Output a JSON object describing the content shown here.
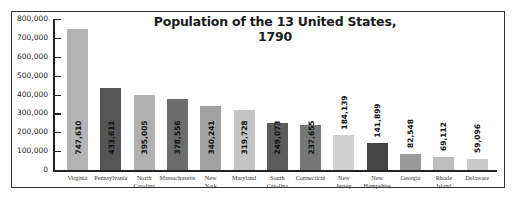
{
  "chart_data": {
    "type": "bar",
    "title": "Population of the 13 United States, 1790",
    "xlabel": "",
    "ylabel": "",
    "ylim": [
      0,
      800000
    ],
    "yticks": [
      "0",
      "100,000",
      "200,000",
      "300,000",
      "400,000",
      "500,000",
      "600,000",
      "700,000",
      "800,000"
    ],
    "grid": false,
    "legend": null,
    "categories": [
      "Virginia",
      "Pennsylvania",
      "North Carolina",
      "Massachusetts",
      "New York",
      "Maryland",
      "South Carolina",
      "Connecticut",
      "New Jersey",
      "New Hampshire",
      "Georgia",
      "Rhode Island",
      "Delaware"
    ],
    "category_lines": [
      [
        "Virginia"
      ],
      [
        "Pennsylvania"
      ],
      [
        "North",
        "Carolina"
      ],
      [
        "Massachusetts"
      ],
      [
        "New",
        "York"
      ],
      [
        "Maryland"
      ],
      [
        "South",
        "Carolina"
      ],
      [
        "Connecticut"
      ],
      [
        "New",
        "Jersey"
      ],
      [
        "New",
        "Hampshire"
      ],
      [
        "Georgia"
      ],
      [
        "Rhode",
        "Island"
      ],
      [
        "Delaware"
      ]
    ],
    "values": [
      747610,
      433611,
      395005,
      378556,
      340241,
      319728,
      249073,
      237655,
      184139,
      141899,
      82548,
      69112,
      59096
    ],
    "value_labels": [
      "747,610",
      "433,611",
      "395,005",
      "378,556",
      "340,241",
      "319,728",
      "249,073",
      "237,655",
      "184,139",
      "141,899",
      "82,548",
      "69,112",
      "59,096"
    ],
    "label_inside": [
      true,
      true,
      true,
      true,
      true,
      true,
      true,
      true,
      false,
      false,
      false,
      false,
      false
    ],
    "colors": [
      "#b4b4b4",
      "#555555",
      "#b0b0b0",
      "#6c6c6c",
      "#a2a2a2",
      "#c4c4c4",
      "#5c5c5c",
      "#777777",
      "#d2d2d2",
      "#454545",
      "#9a9a9a",
      "#bdbdbd",
      "#c9c9c9"
    ]
  }
}
